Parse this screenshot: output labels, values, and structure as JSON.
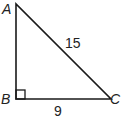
{
  "diagram": {
    "type": "right-triangle",
    "vertices": [
      {
        "name": "A",
        "label": "A",
        "x": 16,
        "y": 4
      },
      {
        "name": "B",
        "label": "B",
        "x": 16,
        "y": 99
      },
      {
        "name": "C",
        "label": "C",
        "x": 111,
        "y": 99
      }
    ],
    "right_angle_at": "B",
    "sides": [
      {
        "name": "AC",
        "label": "15"
      },
      {
        "name": "BC",
        "label": "9"
      }
    ],
    "stroke_color": "#1a1a1a"
  }
}
